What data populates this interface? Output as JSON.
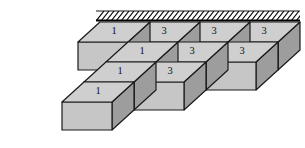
{
  "figure": {
    "type": "isometric-block-diagram",
    "background_color": "#ffffff",
    "colors": {
      "top_face": "#cfcfcf",
      "right_face": "#9d9d9d",
      "front_face": "#c6c6c6",
      "outline": "#1a1a1a",
      "wall_hatch": "#000000",
      "label_text": "#111111"
    },
    "wall": {
      "name": "fixed-support-wall",
      "hatch_direction": "up-right",
      "hatch_line_count": 40,
      "x_start": 96,
      "x_end": 300,
      "y_top": 11,
      "y_bottom": 20
    },
    "geometry": {
      "projection": "oblique",
      "cube_width": 50,
      "depth_dx": -22,
      "depth_dy": 20,
      "cube_height": 28,
      "columns": 4,
      "rows": 4,
      "origin_x": 100,
      "origin_y": 22
    },
    "labels": {
      "rows": [
        {
          "row": 1,
          "cells": [
            "1",
            "3",
            "3",
            "3"
          ]
        },
        {
          "row": 2,
          "cells": [
            "1",
            "3",
            "3",
            ""
          ]
        },
        {
          "row": 3,
          "cells": [
            "1",
            "3",
            "",
            ""
          ]
        },
        {
          "row": 4,
          "cells": [
            "1",
            "",
            "",
            ""
          ]
        }
      ],
      "flat_values": [
        "1",
        "3",
        "3",
        "3",
        "1",
        "3",
        "3",
        "1",
        "3",
        "1"
      ],
      "distinct_values": [
        "1",
        "3"
      ]
    },
    "blocks": [
      {
        "id": "r1c1",
        "label": "1",
        "row": 1,
        "col": 1
      },
      {
        "id": "r1c2",
        "label": "3",
        "row": 1,
        "col": 2
      },
      {
        "id": "r1c3",
        "label": "3",
        "row": 1,
        "col": 3
      },
      {
        "id": "r1c4",
        "label": "3",
        "row": 1,
        "col": 4
      },
      {
        "id": "r2c1",
        "label": "1",
        "row": 2,
        "col": 1
      },
      {
        "id": "r2c2",
        "label": "3",
        "row": 2,
        "col": 2
      },
      {
        "id": "r2c3",
        "label": "3",
        "row": 2,
        "col": 3
      },
      {
        "id": "r3c1",
        "label": "1",
        "row": 3,
        "col": 1
      },
      {
        "id": "r3c2",
        "label": "3",
        "row": 3,
        "col": 2
      },
      {
        "id": "r4c1",
        "label": "1",
        "row": 4,
        "col": 1
      }
    ]
  }
}
